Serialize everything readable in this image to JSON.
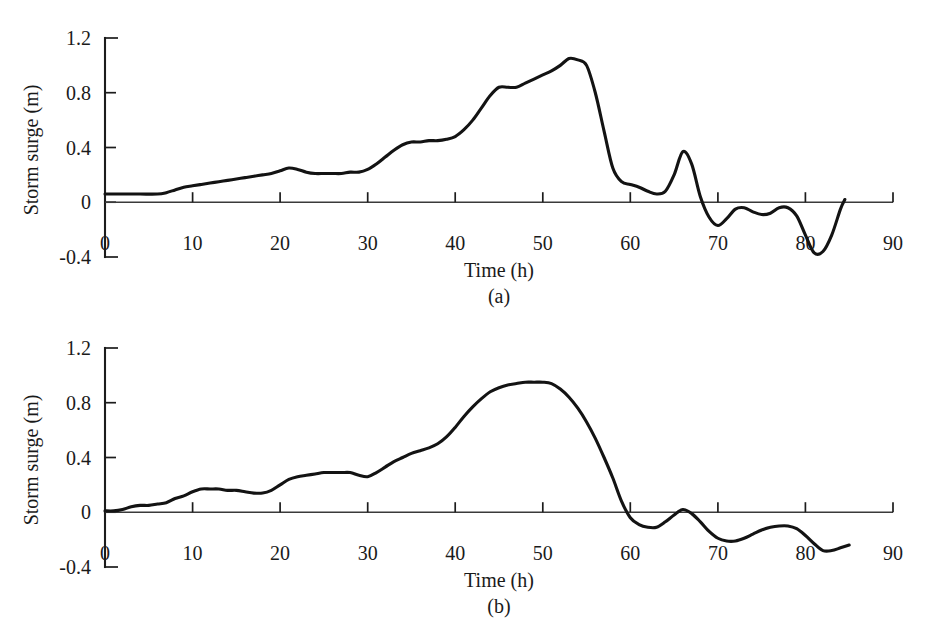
{
  "figure": {
    "background_color": "#ffffff",
    "line_color": "#131313",
    "axis_color": "#1c1c1c"
  },
  "chart_data": [
    {
      "type": "line",
      "panel_label": "(a)",
      "title": "",
      "xlabel": "Time (h)",
      "ylabel": "Storm surge (m)",
      "xlim": [
        0,
        90
      ],
      "ylim": [
        -0.4,
        1.2
      ],
      "xticks": [
        0,
        10,
        20,
        30,
        40,
        50,
        60,
        70,
        80,
        90
      ],
      "xticklabels": [
        "0",
        "10",
        "20",
        "30",
        "40",
        "50",
        "60",
        "70",
        "80",
        "90"
      ],
      "yticks": [
        -0.4,
        0,
        0.4,
        0.8,
        1.2
      ],
      "yticklabels": [
        "-0.4",
        "0",
        "0.4",
        "0.8",
        "1.2"
      ],
      "grid": false,
      "legend": false,
      "series": [
        {
          "name": "Storm surge (a)",
          "x": [
            0,
            2,
            4,
            6,
            7,
            8,
            9,
            10,
            11,
            12,
            13,
            14,
            15,
            16,
            17,
            18,
            19,
            20,
            21,
            22,
            23,
            24,
            25,
            26,
            27,
            28,
            29,
            30,
            31,
            32,
            33,
            34,
            35,
            36,
            37,
            38,
            39,
            40,
            41,
            42,
            43,
            44,
            45,
            46,
            47,
            48,
            49,
            50,
            51,
            52,
            53,
            54,
            55,
            56,
            57,
            58,
            59,
            60,
            61,
            62,
            63,
            64,
            65,
            66,
            67,
            68,
            69,
            70,
            71,
            72,
            73,
            74,
            75,
            76,
            77,
            78,
            79,
            80,
            81,
            82,
            83,
            84,
            84.5
          ],
          "y": [
            0.06,
            0.06,
            0.06,
            0.06,
            0.07,
            0.09,
            0.11,
            0.12,
            0.13,
            0.14,
            0.15,
            0.16,
            0.17,
            0.18,
            0.19,
            0.2,
            0.21,
            0.23,
            0.25,
            0.24,
            0.22,
            0.21,
            0.21,
            0.21,
            0.21,
            0.22,
            0.22,
            0.24,
            0.28,
            0.33,
            0.38,
            0.42,
            0.44,
            0.44,
            0.45,
            0.45,
            0.46,
            0.48,
            0.53,
            0.6,
            0.69,
            0.78,
            0.84,
            0.84,
            0.84,
            0.87,
            0.9,
            0.93,
            0.96,
            1.0,
            1.05,
            1.04,
            1.0,
            0.8,
            0.52,
            0.25,
            0.15,
            0.13,
            0.11,
            0.08,
            0.06,
            0.08,
            0.2,
            0.37,
            0.28,
            0.04,
            -0.11,
            -0.17,
            -0.12,
            -0.05,
            -0.04,
            -0.07,
            -0.09,
            -0.08,
            -0.04,
            -0.04,
            -0.1,
            -0.24,
            -0.37,
            -0.36,
            -0.24,
            -0.05,
            0.02
          ]
        }
      ]
    },
    {
      "type": "line",
      "panel_label": "(b)",
      "title": "",
      "xlabel": "Time (h)",
      "ylabel": "Storm surge (m)",
      "xlim": [
        0,
        90
      ],
      "ylim": [
        -0.4,
        1.2
      ],
      "xticks": [
        0,
        10,
        20,
        30,
        40,
        50,
        60,
        70,
        80,
        90
      ],
      "xticklabels": [
        "0",
        "10",
        "20",
        "30",
        "40",
        "50",
        "60",
        "70",
        "80",
        "90"
      ],
      "yticks": [
        -0.4,
        0,
        0.4,
        0.8,
        1.2
      ],
      "yticklabels": [
        "-0.4",
        "0",
        "0.4",
        "0.8",
        "1.2"
      ],
      "grid": false,
      "legend": false,
      "series": [
        {
          "name": "Storm surge (b)",
          "x": [
            0,
            1,
            2,
            3,
            4,
            5,
            6,
            7,
            8,
            9,
            10,
            11,
            12,
            13,
            14,
            15,
            16,
            17,
            18,
            19,
            20,
            21,
            22,
            23,
            24,
            25,
            26,
            27,
            28,
            29,
            30,
            31,
            32,
            33,
            34,
            35,
            36,
            37,
            38,
            39,
            40,
            41,
            42,
            43,
            44,
            45,
            46,
            47,
            48,
            49,
            50,
            51,
            52,
            53,
            54,
            55,
            56,
            57,
            58,
            59,
            60,
            61,
            62,
            63,
            64,
            65,
            66,
            67,
            68,
            69,
            70,
            71,
            72,
            73,
            74,
            75,
            76,
            77,
            78,
            79,
            80,
            81,
            82,
            83,
            84,
            85
          ],
          "y": [
            0.01,
            0.01,
            0.02,
            0.04,
            0.05,
            0.05,
            0.06,
            0.07,
            0.1,
            0.12,
            0.15,
            0.17,
            0.17,
            0.17,
            0.16,
            0.16,
            0.15,
            0.14,
            0.14,
            0.16,
            0.2,
            0.24,
            0.26,
            0.27,
            0.28,
            0.29,
            0.29,
            0.29,
            0.29,
            0.27,
            0.26,
            0.29,
            0.33,
            0.37,
            0.4,
            0.43,
            0.45,
            0.47,
            0.5,
            0.55,
            0.62,
            0.7,
            0.77,
            0.83,
            0.88,
            0.91,
            0.93,
            0.94,
            0.95,
            0.95,
            0.95,
            0.94,
            0.9,
            0.84,
            0.76,
            0.66,
            0.54,
            0.4,
            0.25,
            0.08,
            -0.04,
            -0.09,
            -0.11,
            -0.11,
            -0.07,
            -0.02,
            0.02,
            -0.01,
            -0.07,
            -0.14,
            -0.19,
            -0.21,
            -0.21,
            -0.19,
            -0.16,
            -0.13,
            -0.11,
            -0.1,
            -0.1,
            -0.12,
            -0.17,
            -0.23,
            -0.28,
            -0.28,
            -0.26,
            -0.24
          ]
        }
      ]
    }
  ]
}
